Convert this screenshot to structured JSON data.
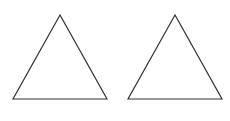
{
  "canvas": {
    "width": 230,
    "height": 121,
    "background": "#ffffff"
  },
  "shapes": [
    {
      "type": "triangle",
      "kind": "equilateral",
      "stroke": "#333333",
      "fill": "none",
      "stroke_width": 1.2,
      "points": [
        [
          60,
          15
        ],
        [
          13,
          99
        ],
        [
          107,
          99
        ]
      ]
    },
    {
      "type": "triangle",
      "kind": "equilateral",
      "stroke": "#333333",
      "fill": "none",
      "stroke_width": 1.2,
      "points": [
        [
          175,
          15
        ],
        [
          128,
          99
        ],
        [
          222,
          99
        ]
      ]
    }
  ]
}
